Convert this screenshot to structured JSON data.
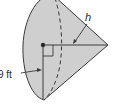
{
  "diagram": {
    "type": "cone",
    "labels": {
      "slant_height": "h",
      "radius": "9 ft"
    },
    "markers": [
      "right-angle",
      "center-point"
    ],
    "colors": {
      "fill": "#cfcfcf",
      "stroke": "#3a3a3a",
      "background": "#ffffff"
    }
  }
}
